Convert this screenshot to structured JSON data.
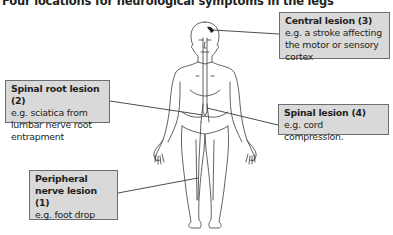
{
  "title": "Four locations for neurological symptoms in the legs",
  "labels": {
    "central": {
      "heading": "Central lesion (3)",
      "example": "e.g. a stroke affecting the motor or sensory cortex"
    },
    "spinal_root": {
      "heading": "Spinal root lesion (2)",
      "example": "e.g. sciatica from lumbar nerve root entrapment"
    },
    "spinal": {
      "heading": "Spinal lesion (4)",
      "example": "e.g. cord compression."
    },
    "peripheral": {
      "heading": "Peripheral nerve lesion (1)",
      "example": "e.g. foot drop"
    }
  },
  "colors": {
    "box_fill": "#d9d9d9",
    "box_border": "#6d6e71",
    "line": "#3a3a3a",
    "lesion_marker": "#231f20"
  }
}
